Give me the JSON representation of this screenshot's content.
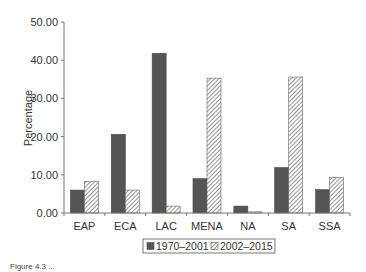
{
  "chart_data": {
    "type": "bar",
    "title": "",
    "xlabel": "",
    "ylabel": "Percentage",
    "ylim": [
      0,
      50
    ],
    "yticks": [
      "0.00",
      "10.00",
      "20.00",
      "30.00",
      "40.00",
      "50.00"
    ],
    "categories": [
      "EAP",
      "ECA",
      "LAC",
      "MENA",
      "NA",
      "SA",
      "SSA"
    ],
    "series": [
      {
        "name": "1970–2001",
        "pattern": "solid",
        "color": "#555555",
        "values": [
          6.0,
          20.6,
          41.8,
          9.0,
          1.8,
          11.9,
          6.1
        ]
      },
      {
        "name": "2002–2015",
        "pattern": "hatched",
        "color": "#bbbbbb",
        "values": [
          8.3,
          6.0,
          1.8,
          35.3,
          0.3,
          35.6,
          9.3
        ]
      }
    ],
    "legend_position": "bottom",
    "grid": false
  },
  "caption": "Figure 4.3 ..."
}
